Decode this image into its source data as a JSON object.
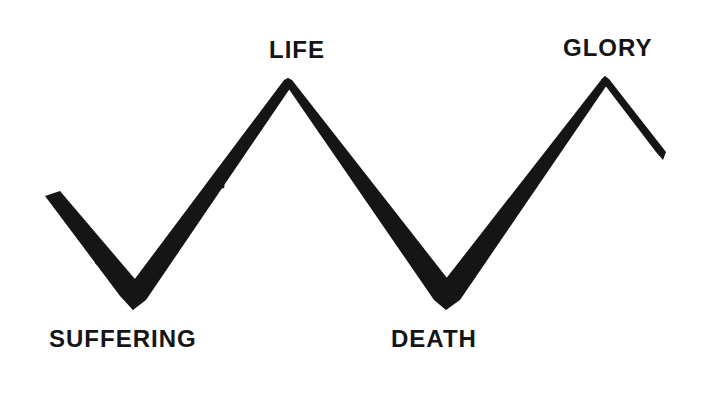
{
  "diagram": {
    "type": "zigzag-line",
    "stroke_color": "#151515",
    "background_color": "#ffffff",
    "labels": {
      "life": "LIFE",
      "glory": "GLORY",
      "suffering": "SUFFERING",
      "death": "DEATH"
    },
    "points": [
      {
        "name": "start",
        "x": 52,
        "y": 197
      },
      {
        "name": "suffering",
        "x": 133,
        "y": 303
      },
      {
        "name": "life",
        "x": 288,
        "y": 81
      },
      {
        "name": "death",
        "x": 446,
        "y": 303
      },
      {
        "name": "glory",
        "x": 605,
        "y": 79
      },
      {
        "name": "end",
        "x": 664,
        "y": 157
      }
    ]
  }
}
